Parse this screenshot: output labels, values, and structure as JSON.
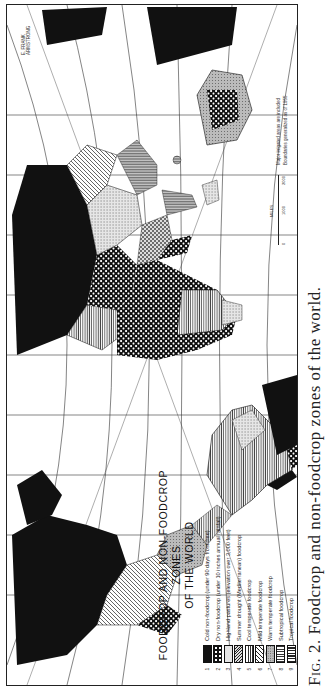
{
  "figure": {
    "caption_prefix": "Fig. 2.",
    "caption_text": "Foodcrop and non-foodcrop zones of the world.",
    "orientation": "rotated 90° counter-clockwise"
  },
  "map": {
    "title_line1": "FOODCROP AND NON-FOODCROP ZONES",
    "title_line2": "OF THE WORLD",
    "credits_line1": "Major irrigated areas are included",
    "credits_line2": "Boundaries generalized as of 1955",
    "corner_label": "E. FRANK ARMSTRONG",
    "scale": {
      "label": "MILES",
      "ticks": [
        "0",
        "1000",
        "2000"
      ]
    },
    "legend": [
      {
        "num": "1",
        "label": "Cold non-foodcrop (under 90 days frost-free)",
        "pattern": "solid-black"
      },
      {
        "num": "2",
        "label": "Dry non-foodcrop (under 10 inches annual rainfall)",
        "pattern": "checker-dots"
      },
      {
        "num": "3",
        "label": "Highland pastures (elevation over 3,000 feet)",
        "pattern": "fine-stipple"
      },
      {
        "num": "4",
        "label": "Summer drought (Mediterranean) foodcrop",
        "pattern": "cross-hatch"
      },
      {
        "num": "5",
        "label": "Cool temperate foodcrop",
        "pattern": "horizontal-lines"
      },
      {
        "num": "6",
        "label": "Mild temperate foodcrop",
        "pattern": "diagonal-lines"
      },
      {
        "num": "7",
        "label": "Warm temperate foodcrop",
        "pattern": "dotted-grey"
      },
      {
        "num": "8",
        "label": "Subtropical foodcrop",
        "pattern": "vertical-lines"
      },
      {
        "num": "9",
        "label": "Tropical foodcrop",
        "pattern": "dense-vertical"
      }
    ],
    "colors": {
      "ink": "#111111",
      "paper": "#ffffff",
      "grey": "#9a9a9a"
    }
  }
}
